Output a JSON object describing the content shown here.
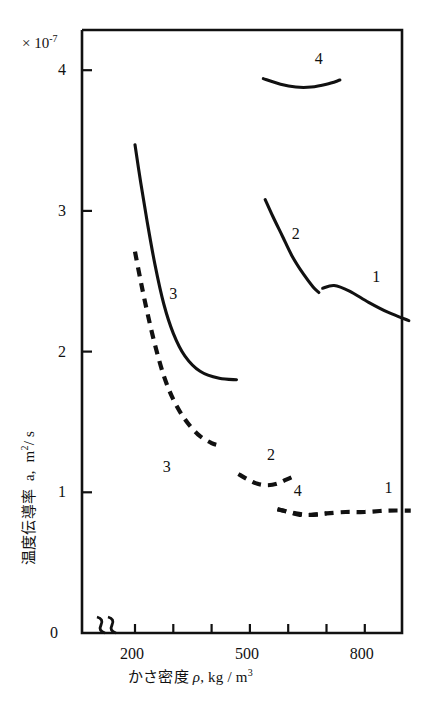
{
  "figure": {
    "axis_multiplier": "× 10",
    "axis_multiplier_exp": "-7",
    "y_axis_title_main": "温度伝導率",
    "y_axis_title_symbol": "a",
    "y_axis_title_unit": "m",
    "y_axis_title_unit_exp": "2",
    "y_axis_title_unit_tail": "/ s",
    "x_axis_title_main": "かさ密度",
    "x_axis_title_symbol": "ρ",
    "x_axis_title_unit": "kg / m",
    "x_axis_title_unit_exp": "3",
    "break_symbol": "axis-break-squiggle"
  },
  "chart_data": {
    "type": "line",
    "title": "",
    "xlabel": "かさ密度 ρ, kg / m3",
    "ylabel": "温度伝導率 a, m2 / s",
    "y_multiplier": "1e-7",
    "xlim": [
      150,
      950
    ],
    "ylim": [
      0,
      4.3
    ],
    "x_ticks": [
      200,
      300,
      400,
      500,
      600,
      700,
      800
    ],
    "x_tick_labels": [
      "200",
      "",
      "",
      "500",
      "",
      "",
      "800"
    ],
    "y_ticks": [
      0,
      1,
      2,
      3,
      4
    ],
    "y_tick_labels": [
      "0",
      "1",
      "2",
      "3",
      "4"
    ],
    "grid": false,
    "legend": "inline-curve-labels",
    "axis_break_x": true,
    "series": [
      {
        "name": "1",
        "label": "1",
        "style": "solid",
        "points": [
          [
            690,
            2.45
          ],
          [
            720,
            2.47
          ],
          [
            760,
            2.43
          ],
          [
            810,
            2.35
          ],
          [
            860,
            2.28
          ],
          [
            915,
            2.22
          ]
        ]
      },
      {
        "name": "2",
        "label": "2",
        "style": "solid",
        "points": [
          [
            540,
            3.08
          ],
          [
            560,
            2.96
          ],
          [
            585,
            2.82
          ],
          [
            610,
            2.68
          ],
          [
            640,
            2.55
          ],
          [
            665,
            2.46
          ],
          [
            680,
            2.42
          ]
        ]
      },
      {
        "name": "3",
        "label": "3",
        "style": "solid",
        "points": [
          [
            200,
            3.47
          ],
          [
            215,
            3.2
          ],
          [
            232,
            2.92
          ],
          [
            252,
            2.62
          ],
          [
            275,
            2.34
          ],
          [
            300,
            2.13
          ],
          [
            330,
            1.97
          ],
          [
            370,
            1.86
          ],
          [
            420,
            1.81
          ],
          [
            465,
            1.8
          ]
        ]
      },
      {
        "name": "4",
        "label": "4",
        "style": "solid",
        "points": [
          [
            535,
            3.94
          ],
          [
            580,
            3.9
          ],
          [
            620,
            3.88
          ],
          [
            660,
            3.88
          ],
          [
            700,
            3.9
          ],
          [
            735,
            3.93
          ]
        ]
      },
      {
        "name": "3d",
        "label": "3",
        "style": "dashed",
        "points": [
          [
            200,
            2.71
          ],
          [
            215,
            2.5
          ],
          [
            232,
            2.28
          ],
          [
            252,
            2.05
          ],
          [
            275,
            1.83
          ],
          [
            300,
            1.66
          ],
          [
            330,
            1.52
          ],
          [
            365,
            1.41
          ],
          [
            400,
            1.35
          ],
          [
            425,
            1.33
          ]
        ]
      },
      {
        "name": "2d",
        "label": "2",
        "style": "dashed",
        "points": [
          [
            470,
            1.13
          ],
          [
            495,
            1.09
          ],
          [
            520,
            1.06
          ],
          [
            545,
            1.05
          ],
          [
            570,
            1.06
          ],
          [
            595,
            1.09
          ],
          [
            620,
            1.12
          ]
        ]
      },
      {
        "name": "1d",
        "label": "1",
        "style": "dashed",
        "points": [
          [
            572,
            0.88
          ],
          [
            600,
            0.86
          ],
          [
            630,
            0.84
          ],
          [
            665,
            0.84
          ],
          [
            700,
            0.85
          ],
          [
            750,
            0.86
          ],
          [
            800,
            0.86
          ],
          [
            860,
            0.87
          ],
          [
            920,
            0.87
          ]
        ]
      },
      {
        "name": "4d",
        "label": "4",
        "style": "dashed",
        "points": [
          [
            572,
            0.88
          ],
          [
            620,
            0.85
          ],
          [
            660,
            0.84
          ],
          [
            700,
            0.85
          ]
        ]
      }
    ],
    "curve_labels": [
      {
        "text": "4",
        "x": 680,
        "y": 4.07
      },
      {
        "text": "2",
        "x": 620,
        "y": 2.83
      },
      {
        "text": "1",
        "x": 830,
        "y": 2.52
      },
      {
        "text": "3",
        "x": 300,
        "y": 2.4
      },
      {
        "text": "3",
        "x": 283,
        "y": 1.17
      },
      {
        "text": "2",
        "x": 555,
        "y": 1.26
      },
      {
        "text": "4",
        "x": 625,
        "y": 1.0
      },
      {
        "text": "1",
        "x": 862,
        "y": 1.02
      }
    ]
  }
}
